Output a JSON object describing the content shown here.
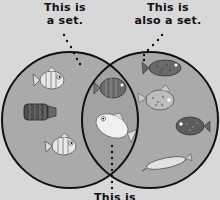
{
  "labels": {
    "left": [
      "This is",
      "a set."
    ],
    "right": [
      "This is",
      "also a set."
    ],
    "bottom": [
      "This is"
    ]
  },
  "colors": {
    "background": "#d8d8d8",
    "circle_fill": "#a9a9a9",
    "circle_stroke": "#111111",
    "fish_light": "#e6e6e6",
    "fish_dark": "#5e5e5e"
  },
  "sets": {
    "left": {
      "name": "left-set",
      "members": [
        "light-striped-fish",
        "dark-striped-fish",
        "light-striped-fish"
      ]
    },
    "intersection": {
      "name": "intersection",
      "members": [
        "dark-striped-fish",
        "light-large-fish"
      ]
    },
    "right": {
      "name": "right-set",
      "members": [
        "dark-spotted-fish",
        "light-spotted-fish",
        "dark-spotted-fish",
        "long-light-fish"
      ]
    }
  }
}
